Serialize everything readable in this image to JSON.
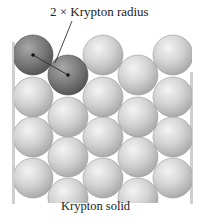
{
  "diagram": {
    "top_label": "2 × Krypton radius",
    "bottom_label": "Krypton solid",
    "colors": {
      "sphere_light": "#d4d4d4",
      "sphere_dark": "#7a7a7a",
      "wall": "#cfcfcf",
      "line": "#333333"
    },
    "sphere_radius": 20,
    "spheres_col_a": {
      "x": [
        33,
        103,
        173
      ],
      "y": [
        55,
        97,
        137,
        178
      ]
    },
    "spheres_col_b": {
      "x": [
        68,
        138
      ],
      "y": [
        75,
        117,
        157,
        198
      ]
    },
    "highlighted_spheres": [
      [
        33,
        55
      ],
      [
        68,
        75
      ]
    ]
  }
}
